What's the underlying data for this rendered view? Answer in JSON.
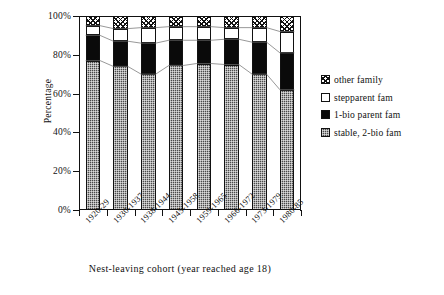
{
  "chart_data": {
    "type": "bar",
    "subtype": "100% stacked bar",
    "title": "",
    "xlabel": "Nest-leaving cohort (year reached age 18)",
    "ylabel": "Percentage",
    "ylim": [
      0,
      100
    ],
    "yticks": [
      0,
      20,
      40,
      60,
      80,
      100
    ],
    "ytick_labels": [
      "0%",
      "20%",
      "40%",
      "60%",
      "80%",
      "100%"
    ],
    "grid": false,
    "legend_position": "right",
    "stack_order_bottom_to_top": [
      "stable, 2-bio fam",
      "1-bio parent fam",
      "stepparent fam",
      "other family"
    ],
    "categories": [
      "1920-29",
      "1930-1937",
      "1938-1944",
      "1945-1958",
      "1959-1965",
      "1966-1972",
      "1973-1979",
      "1980-85"
    ],
    "series": [
      {
        "name": "stable, 2-bio fam",
        "color": "#4a4a4a",
        "pattern": "gray-dither",
        "values": [
          77,
          74,
          70,
          74.5,
          75.5,
          75,
          70,
          62
        ]
      },
      {
        "name": "1-bio parent fam",
        "color": "#0a0a0a",
        "pattern": "solid-black",
        "values": [
          13,
          13,
          16,
          13,
          12,
          13,
          16.5,
          19
        ]
      },
      {
        "name": "stepparent fam",
        "color": "#ffffff",
        "pattern": "white",
        "values": [
          5,
          6.5,
          8,
          7,
          7,
          6,
          7.5,
          11
        ]
      },
      {
        "name": "other family",
        "color": "#ffffff",
        "pattern": "cross-hatch",
        "values": [
          5,
          6.5,
          6,
          5.5,
          5.5,
          6,
          6,
          8
        ]
      }
    ],
    "cumulative_boundaries": [
      [
        77,
        90,
        95,
        100
      ],
      [
        74,
        87,
        93.5,
        100
      ],
      [
        70,
        86,
        94,
        100
      ],
      [
        74.5,
        87.5,
        94.5,
        100
      ],
      [
        75.5,
        87.5,
        94.5,
        100
      ],
      [
        75,
        88,
        94,
        100
      ],
      [
        70,
        86.5,
        94,
        100
      ],
      [
        62,
        81,
        92,
        100
      ]
    ]
  },
  "axes": {
    "y_title": "Percentage",
    "x_title": "Nest-leaving cohort (year reached age 18)",
    "y_tick_labels": [
      "100%",
      "80%",
      "60%",
      "40%",
      "20%",
      "0%"
    ],
    "x_tick_labels": [
      "1920-29",
      "1930-1937",
      "1938-1944",
      "1945-1958",
      "1959-1965",
      "1966-1972",
      "1973-1979",
      "1980-85"
    ]
  },
  "legend": {
    "items": [
      {
        "label": "other family",
        "swatch": "cross-hatch-swatch"
      },
      {
        "label": "stepparent fam",
        "swatch": "white-swatch"
      },
      {
        "label": "1-bio parent fam",
        "swatch": "black-swatch"
      },
      {
        "label": "stable, 2-bio fam",
        "swatch": "gray-swatch"
      }
    ]
  }
}
